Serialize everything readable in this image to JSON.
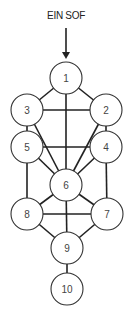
{
  "title": "EIN SOF",
  "nodes": [
    {
      "id": "1",
      "label": "1",
      "x": 66,
      "y": 78
    },
    {
      "id": "2",
      "label": "2",
      "x": 106,
      "y": 110
    },
    {
      "id": "3",
      "label": "3",
      "x": 27,
      "y": 110
    },
    {
      "id": "4",
      "label": "4",
      "x": 106,
      "y": 147
    },
    {
      "id": "5",
      "label": "5",
      "x": 27,
      "y": 147
    },
    {
      "id": "6",
      "label": "6",
      "x": 66,
      "y": 185
    },
    {
      "id": "7",
      "label": "7",
      "x": 107,
      "y": 214
    },
    {
      "id": "8",
      "label": "8",
      "x": 27,
      "y": 214
    },
    {
      "id": "9",
      "label": "9",
      "x": 67,
      "y": 248
    },
    {
      "id": "10",
      "label": "10",
      "x": 67,
      "y": 289
    }
  ],
  "edges": [
    [
      "1",
      "2"
    ],
    [
      "1",
      "3"
    ],
    [
      "1",
      "6"
    ],
    [
      "2",
      "3"
    ],
    [
      "2",
      "4"
    ],
    [
      "2",
      "6"
    ],
    [
      "3",
      "5"
    ],
    [
      "3",
      "6"
    ],
    [
      "4",
      "5"
    ],
    [
      "4",
      "6"
    ],
    [
      "4",
      "7"
    ],
    [
      "5",
      "6"
    ],
    [
      "5",
      "8"
    ],
    [
      "6",
      "7"
    ],
    [
      "6",
      "8"
    ],
    [
      "6",
      "9"
    ],
    [
      "7",
      "8"
    ],
    [
      "7",
      "9"
    ],
    [
      "8",
      "9"
    ],
    [
      "9",
      "10"
    ]
  ],
  "node_radius": 16
}
